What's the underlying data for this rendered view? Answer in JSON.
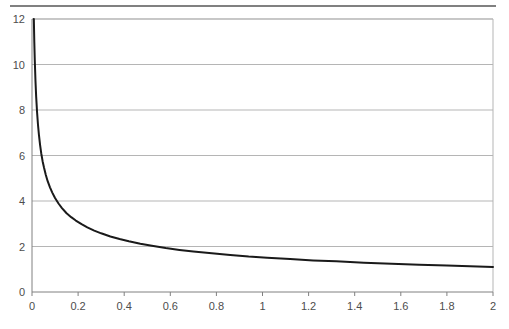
{
  "chart_data": {
    "type": "line",
    "title": "",
    "subtitle": "",
    "xlabel": "",
    "ylabel": "",
    "xlim": [
      0,
      2
    ],
    "ylim": [
      0,
      12
    ],
    "grid": true,
    "grid_axis": "y",
    "legend": false,
    "legend_position": "none",
    "x_ticks": [
      0,
      0.2,
      0.4,
      0.6,
      0.8,
      1,
      1.2,
      1.4,
      1.6,
      1.8,
      2
    ],
    "x_tick_labels": [
      "0",
      "0.2",
      "0.4",
      "0.6",
      "0.8",
      "1",
      "1.2",
      "1.4",
      "1.6",
      "1.8",
      "2"
    ],
    "y_ticks": [
      0,
      2,
      4,
      6,
      8,
      10,
      12
    ],
    "y_tick_labels": [
      "0",
      "2",
      "4",
      "6",
      "8",
      "10",
      "12"
    ],
    "series": [
      {
        "name": "curve",
        "color": "#1a1a1a",
        "line_width": 2,
        "x": [
          0.008,
          0.01,
          0.012,
          0.015,
          0.018,
          0.022,
          0.026,
          0.03,
          0.035,
          0.04,
          0.046,
          0.052,
          0.06,
          0.068,
          0.078,
          0.088,
          0.1,
          0.115,
          0.13,
          0.15,
          0.17,
          0.19,
          0.215,
          0.24,
          0.27,
          0.3,
          0.34,
          0.38,
          0.42,
          0.47,
          0.52,
          0.58,
          0.64,
          0.7,
          0.78,
          0.86,
          0.94,
          1.02,
          1.12,
          1.22,
          1.32,
          1.44,
          1.56,
          1.68,
          1.8,
          1.9,
          2.0
        ],
        "y": [
          12.0,
          11.0,
          10.2,
          9.3,
          8.6,
          7.9,
          7.35,
          6.92,
          6.47,
          6.1,
          5.75,
          5.47,
          5.14,
          4.87,
          4.6,
          4.37,
          4.13,
          3.89,
          3.69,
          3.46,
          3.29,
          3.14,
          2.98,
          2.84,
          2.7,
          2.58,
          2.44,
          2.33,
          2.23,
          2.12,
          2.03,
          1.93,
          1.85,
          1.78,
          1.7,
          1.63,
          1.56,
          1.51,
          1.45,
          1.39,
          1.35,
          1.29,
          1.24,
          1.2,
          1.16,
          1.13,
          1.1
        ]
      }
    ],
    "colors": {
      "curve": "#1a1a1a",
      "gridline": "#b5b5b5",
      "axis": "#808080",
      "plot_border": "#b5b5b5",
      "top_rule": "#808080",
      "tick_label": "#4d4d4d",
      "background": "#ffffff"
    },
    "geometry": {
      "plot_left": 32,
      "plot_right": 493,
      "plot_top": 19,
      "plot_bottom": 292
    }
  }
}
